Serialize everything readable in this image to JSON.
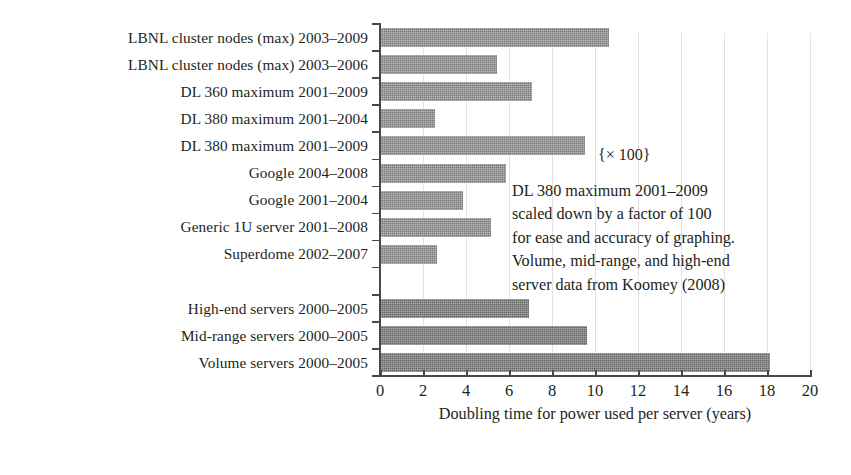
{
  "chart_data": {
    "type": "bar",
    "orientation": "horizontal",
    "title": "",
    "subtitle": "",
    "xlabel": "Doubling time for power used per server (years)",
    "ylabel": "",
    "xlim": [
      0,
      20
    ],
    "xticks": [
      0,
      2,
      4,
      6,
      8,
      10,
      12,
      14,
      16,
      18,
      20
    ],
    "xticklabels": [
      "0",
      "2",
      "4",
      "6",
      "8",
      "10",
      "12",
      "14",
      "16",
      "18",
      "20"
    ],
    "grid": "vertical",
    "legend": "none",
    "categories": [
      "LBNL cluster nodes (max) 2003–2009",
      "LBNL cluster nodes (max) 2003–2006",
      "DL 360 maximum 2001–2009",
      "DL 380 maximum 2001–2004",
      "DL 380 maximum 2001–2009",
      "Google 2004–2008",
      "Google 2001–2004",
      "Generic 1U server 2001–2008",
      "Superdome 2002–2007",
      "",
      "High-end servers 2000–2005",
      "Mid-range servers 2000–2005",
      "Volume servers 2000–2005"
    ],
    "values": [
      10.6,
      5.4,
      7.0,
      2.5,
      9.5,
      5.8,
      3.8,
      5.1,
      2.6,
      null,
      6.9,
      9.6,
      18.1
    ],
    "bar_colors": [
      "#8c8c8c",
      "#8c8c8c",
      "#8c8c8c",
      "#8c8c8c",
      "#8c8c8c",
      "#8c8c8c",
      "#8c8c8c",
      "#8c8c8c",
      "#8c8c8c",
      null,
      "#767676",
      "#767676",
      "#767676"
    ],
    "annotations": [
      {
        "name": "scale-multiplier",
        "text": "{× 100}",
        "attached_to": "DL 380 maximum 2001–2009"
      },
      {
        "name": "source-note",
        "lines": [
          "DL 380 maximum 2001–2009",
          "scaled down by a factor of 100",
          "for ease and accuracy of graphing.",
          "Volume, mid-range, and high-end",
          "server data from Koomey (2008)"
        ]
      }
    ]
  },
  "axis": {
    "x_title": "Doubling time for power used per server (years)",
    "tick_labels": [
      "0",
      "2",
      "4",
      "6",
      "8",
      "10",
      "12",
      "14",
      "16",
      "18",
      "20"
    ]
  },
  "labels": [
    "LBNL cluster nodes (max) 2003–2009",
    "LBNL cluster nodes (max) 2003–2006",
    "DL 360 maximum 2001–2009",
    "DL 380 maximum 2001–2004",
    "DL 380 maximum 2001–2009",
    "Google 2004–2008",
    "Google 2001–2004",
    "Generic 1U server 2001–2008",
    "Superdome 2002–2007",
    "",
    "High-end servers 2000–2005",
    "Mid-range servers 2000–2005",
    "Volume servers 2000–2005"
  ],
  "note": {
    "multiplier": "{× 100}",
    "line1": "DL 380 maximum 2001–2009",
    "line2": "scaled down by a factor of 100",
    "line3": "for ease and accuracy of graphing.",
    "line4": "Volume, mid-range, and high-end",
    "line5": "server data from Koomey (2008)"
  },
  "colors": {
    "bar_light": "#8c8c8c",
    "bar_dark": "#767676",
    "axis": "#4b4745",
    "grid": "#e3e3e3",
    "text": "#231f20",
    "background": "#ffffff"
  }
}
